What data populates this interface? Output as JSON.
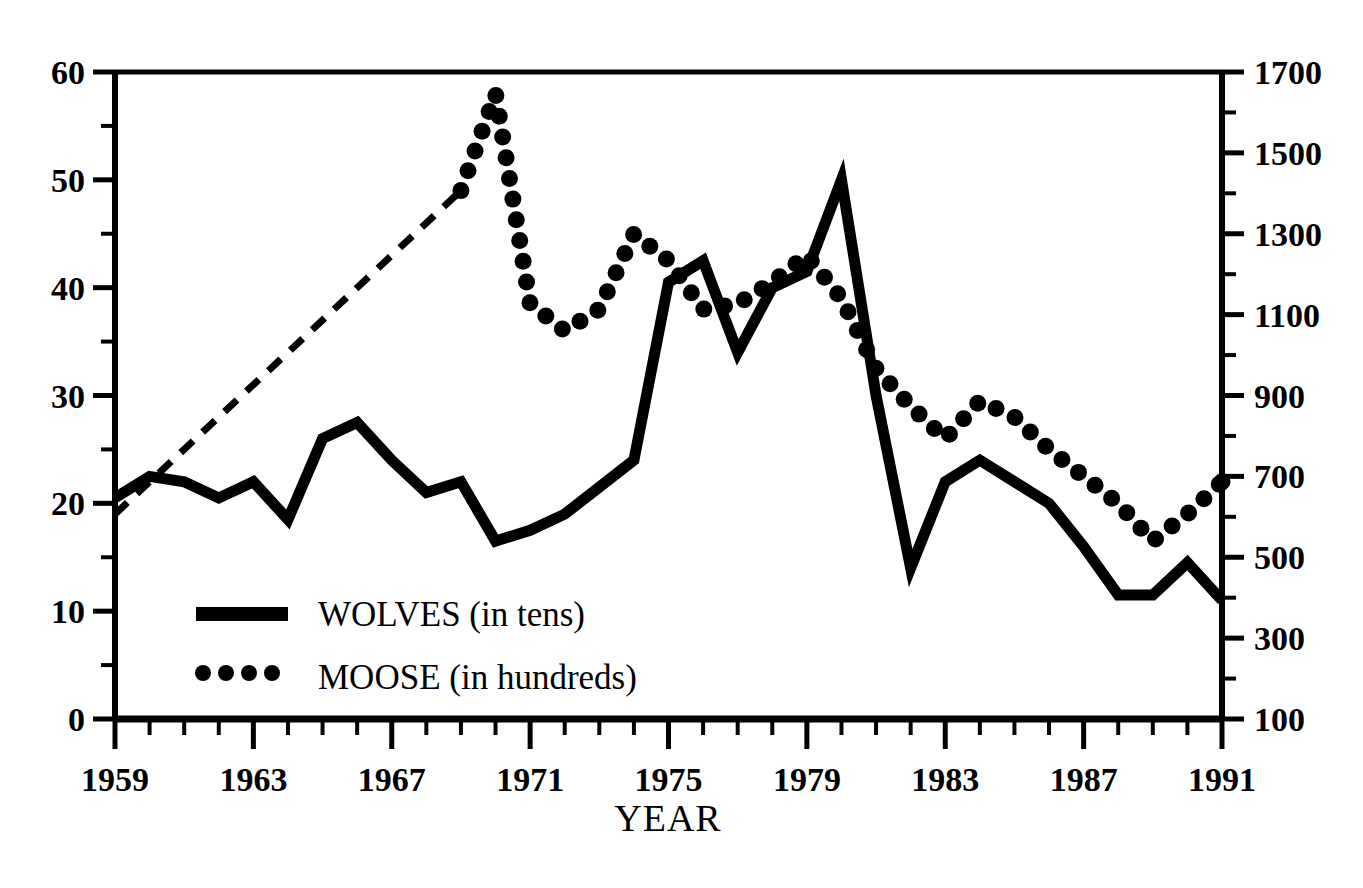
{
  "chart_data": {
    "type": "line",
    "title": "",
    "xlabel": "YEAR",
    "ylabel_left": "",
    "ylabel_right": "",
    "xlim": [
      1959,
      1991
    ],
    "ylim_left": [
      0,
      60
    ],
    "ylim_right": [
      100,
      1700
    ],
    "grid": false,
    "legend_position": "inside-lower-left",
    "x": [
      1959,
      1960,
      1961,
      1962,
      1963,
      1964,
      1965,
      1966,
      1967,
      1968,
      1969,
      1970,
      1971,
      1972,
      1973,
      1974,
      1975,
      1976,
      1977,
      1978,
      1979,
      1980,
      1981,
      1982,
      1983,
      1984,
      1985,
      1986,
      1987,
      1988,
      1989,
      1990,
      1991
    ],
    "xticks_labeled": [
      1959,
      1963,
      1967,
      1971,
      1975,
      1979,
      1983,
      1987,
      1991
    ],
    "yticks_left_labeled": [
      0,
      10,
      20,
      30,
      40,
      50,
      60
    ],
    "yticks_right_labeled": [
      100,
      300,
      500,
      700,
      900,
      1100,
      1300,
      1500,
      1700
    ],
    "series": [
      {
        "name": "WOLVES (in tens)",
        "legend_label": "WOLVES (in tens)",
        "style": "solid",
        "axis": "left",
        "units": "tens of wolves",
        "values": [
          20.5,
          22.5,
          22.0,
          20.5,
          22.0,
          18.5,
          26.0,
          27.5,
          24.0,
          21.0,
          22.0,
          16.5,
          17.5,
          19.0,
          21.5,
          24.0,
          40.5,
          42.5,
          34.0,
          40.0,
          41.5,
          50.0,
          30.0,
          14.0,
          22.0,
          24.0,
          22.0,
          20.0,
          16.0,
          11.5,
          11.5,
          14.5,
          11.0
        ],
        "wolf_counts": [
          20,
          22,
          22,
          20,
          22,
          19,
          26,
          28,
          24,
          21,
          22,
          17,
          18,
          19,
          22,
          24,
          41,
          43,
          34,
          40,
          42,
          50,
          30,
          14,
          22,
          24,
          22,
          20,
          16,
          12,
          12,
          15,
          11
        ]
      },
      {
        "name": "MOOSE (in hundreds)",
        "legend_label": "MOOSE (in hundreds)",
        "style": "dotted",
        "axis": "right",
        "units": "hundreds of moose",
        "interpolated_segment_years": [
          1959,
          1969
        ],
        "interpolated_segment_style": "dashed",
        "values_left_scale": [
          19.0,
          22.0,
          25.0,
          28.0,
          31.0,
          34.0,
          37.0,
          40.0,
          43.0,
          46.5,
          49.0,
          58.0,
          38.5,
          36.0,
          38.0,
          45.0,
          42.5,
          38.0,
          38.5,
          40.5,
          43.0,
          39.0,
          32.5,
          29.0,
          26.0,
          29.5,
          28.0,
          25.0,
          22.5,
          20.0,
          16.5,
          19.0,
          22.0
        ],
        "moose_counts": [
          600,
          680,
          760,
          840,
          920,
          1000,
          1080,
          1160,
          1240,
          1340,
          1400,
          1660,
          1140,
          1080,
          1120,
          1310,
          1250,
          1120,
          1140,
          1190,
          1250,
          1160,
          990,
          900,
          830,
          910,
          870,
          790,
          730,
          670,
          580,
          640,
          700
        ]
      }
    ],
    "annotation": "Moose data from 1959 to 1969 shown as a dashed straight-line interpolation; dotted markers thereafter."
  },
  "axes": {
    "left": {
      "name": "left-axis",
      "labels": [
        "60",
        "50",
        "40",
        "30",
        "20",
        "10",
        "0"
      ],
      "values": [
        60,
        50,
        40,
        30,
        20,
        10,
        0
      ]
    },
    "right": {
      "name": "right-axis",
      "labels": [
        "1700",
        "1500",
        "1300",
        "1100",
        "900",
        "700",
        "500",
        "300",
        "100"
      ],
      "values": [
        1700,
        1500,
        1300,
        1100,
        900,
        700,
        500,
        300,
        100
      ]
    },
    "bottom": {
      "name": "x-axis",
      "title": "YEAR",
      "labels": [
        "1959",
        "1963",
        "1967",
        "1971",
        "1975",
        "1979",
        "1983",
        "1987",
        "1991"
      ],
      "values": [
        1959,
        1963,
        1967,
        1971,
        1975,
        1979,
        1983,
        1987,
        1991
      ]
    }
  },
  "legend": {
    "entries": [
      {
        "label": "WOLVES (in tens)",
        "style": "solid"
      },
      {
        "label": "MOOSE (in hundreds)",
        "style": "dotted"
      }
    ]
  },
  "colors": {
    "ink": "#000000",
    "background": "#ffffff"
  }
}
